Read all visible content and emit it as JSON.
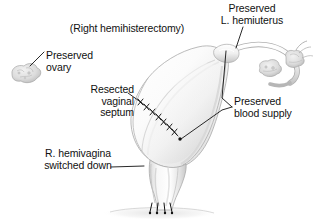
{
  "figure": {
    "kind": "medical-illustration",
    "background_color": "#ffffff",
    "ink_color": "#111111",
    "tissue_fill": "#f4f4f4",
    "tissue_shade": "#c9c9c9",
    "suture_color": "#111111"
  },
  "title": {
    "text": "(Right hemihisterectomy)"
  },
  "labels": {
    "preserved_hemiuterus": {
      "line1": "Preserved",
      "line2": "L. hemiuterus",
      "text": "Preserved\nL. hemiuterus"
    },
    "preserved_ovary": {
      "line1": "Preserved",
      "line2": "ovary",
      "text": "Preserved\novary"
    },
    "resected_vaginal_septum": {
      "line1": "Resected",
      "line2": "vaginal",
      "line3": "septum",
      "text": "Resected\nvaginal\nseptum"
    },
    "preserved_blood_supply": {
      "line1": "Preserved",
      "line2": "blood supply",
      "text": "Preserved\nblood supply"
    },
    "r_hemivagina": {
      "line1": "R. hemivagina",
      "line2": "switched down",
      "text": "R. hemivagina\nswitched down"
    }
  },
  "anatomy": {
    "parts": [
      "preserved-left-ovary",
      "uterine-corpus",
      "left-fallopian-tube",
      "right-adnexa",
      "suture-line",
      "vaginal-canal",
      "vaginal-introitus-sutures"
    ]
  }
}
